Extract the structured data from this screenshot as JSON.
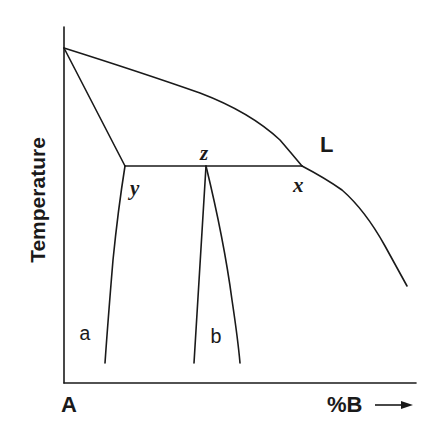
{
  "diagram": {
    "type": "binary phase diagram",
    "axes": {
      "y_label": "Temperature",
      "x_origin_label": "A",
      "x_label": "%B",
      "x_arrow": "→"
    },
    "labels": {
      "liquid": "L",
      "point_x": "x",
      "point_y": "y",
      "point_z": "z",
      "phase_a": "a",
      "phase_b": "b"
    },
    "colors": {
      "line": "#1a1a1a",
      "background": "#ffffff"
    }
  }
}
